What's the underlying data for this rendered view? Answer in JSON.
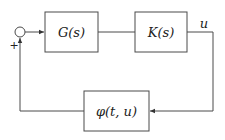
{
  "diagram": {
    "type": "feedback block diagram",
    "blocks": [
      {
        "id": "G",
        "label": "G(s)"
      },
      {
        "id": "K",
        "label": "K(s)"
      },
      {
        "id": "phi",
        "label": "φ(t, u)"
      }
    ],
    "signals": {
      "output_label": "u",
      "sum_sign": "+"
    },
    "connections": [
      {
        "from": "sum",
        "to": "G"
      },
      {
        "from": "G",
        "to": "K"
      },
      {
        "from": "K",
        "to": "phi",
        "signal": "u"
      },
      {
        "from": "phi",
        "to": "sum",
        "sign": "+"
      }
    ],
    "colors": {
      "stroke": "#4a4a4a",
      "background": "#ffffff"
    }
  }
}
